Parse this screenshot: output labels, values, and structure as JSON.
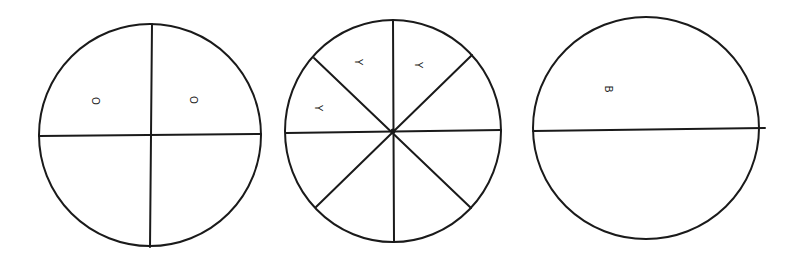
{
  "diagram": {
    "stroke_color": "#1a1a1a",
    "background": "#ffffff",
    "circles": [
      {
        "id": "circle-quarters",
        "divisions": 4,
        "labels": [
          {
            "text": "O",
            "x": 95,
            "y": 101
          },
          {
            "text": "O",
            "x": 193,
            "y": 100
          }
        ]
      },
      {
        "id": "circle-eighths",
        "divisions": 8,
        "labels": [
          {
            "text": "Y",
            "x": 358,
            "y": 62
          },
          {
            "text": "Y",
            "x": 418,
            "y": 65
          },
          {
            "text": "Y",
            "x": 318,
            "y": 108
          }
        ]
      },
      {
        "id": "circle-halves",
        "divisions": 2,
        "labels": [
          {
            "text": "B",
            "x": 608,
            "y": 89
          }
        ]
      }
    ]
  }
}
